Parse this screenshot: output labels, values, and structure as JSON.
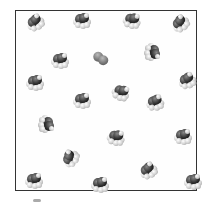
{
  "figure": {
    "type": "particle-box-diagram",
    "colors": {
      "border": "#333333",
      "carbon": "#2a2a2a",
      "hydrogen": "#d0d0d0",
      "diatomic": "#777777"
    },
    "molecules": [
      {
        "kind": "poly",
        "x": 35,
        "y": 22,
        "rot": -30
      },
      {
        "kind": "poly",
        "x": 82,
        "y": 20,
        "rot": 0
      },
      {
        "kind": "poly",
        "x": 132,
        "y": 20,
        "rot": 10
      },
      {
        "kind": "poly",
        "x": 180,
        "y": 23,
        "rot": -40
      },
      {
        "kind": "poly",
        "x": 60,
        "y": 60,
        "rot": 0
      },
      {
        "kind": "diatomic",
        "x": 101,
        "y": 58,
        "rot": 25
      },
      {
        "kind": "poly",
        "x": 153,
        "y": 52,
        "rot": 90
      },
      {
        "kind": "poly",
        "x": 35,
        "y": 82,
        "rot": 0
      },
      {
        "kind": "poly",
        "x": 187,
        "y": 80,
        "rot": -20
      },
      {
        "kind": "poly",
        "x": 82,
        "y": 100,
        "rot": 0
      },
      {
        "kind": "poly",
        "x": 121,
        "y": 92,
        "rot": 20
      },
      {
        "kind": "poly",
        "x": 155,
        "y": 102,
        "rot": -10
      },
      {
        "kind": "poly",
        "x": 47,
        "y": 124,
        "rot": 90
      },
      {
        "kind": "poly",
        "x": 116,
        "y": 137,
        "rot": 10
      },
      {
        "kind": "poly",
        "x": 183,
        "y": 136,
        "rot": 0
      },
      {
        "kind": "poly",
        "x": 70,
        "y": 158,
        "rot": -60
      },
      {
        "kind": "poly",
        "x": 148,
        "y": 170,
        "rot": -30
      },
      {
        "kind": "poly",
        "x": 34,
        "y": 180,
        "rot": 0
      },
      {
        "kind": "poly",
        "x": 100,
        "y": 184,
        "rot": 0
      },
      {
        "kind": "poly",
        "x": 193,
        "y": 181,
        "rot": 0
      }
    ]
  }
}
